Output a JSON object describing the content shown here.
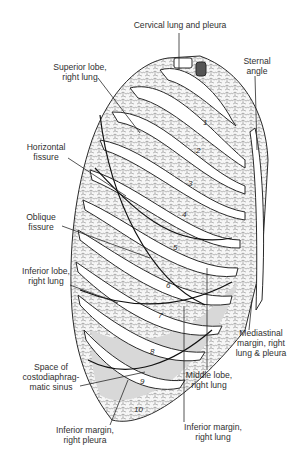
{
  "figure": {
    "rib_numbers": [
      "1",
      "2",
      "3",
      "4",
      "5",
      "6",
      "7",
      "8",
      "9",
      "10"
    ]
  },
  "labels": {
    "cervical": {
      "lines": [
        "Cervical lung and pleura"
      ]
    },
    "superior_lobe": {
      "lines": [
        "Superior lobe,",
        "right lung"
      ]
    },
    "sternal_angle": {
      "lines": [
        "Sternal",
        "angle"
      ]
    },
    "horizontal_fissure": {
      "lines": [
        "Horizontal",
        "fissure"
      ]
    },
    "oblique_fissure": {
      "lines": [
        "Oblique",
        "fissure"
      ]
    },
    "inferior_lobe": {
      "lines": [
        "Inferior lobe,",
        "right lung"
      ]
    },
    "mediastinal_margin": {
      "lines": [
        "Mediastinal",
        "margin, right",
        "lung & pleura"
      ]
    },
    "costodiaphragmatic": {
      "lines": [
        "Space of",
        "costodiaphrag-",
        "matic sinus"
      ]
    },
    "middle_lobe": {
      "lines": [
        "Middle lobe,",
        "right lung"
      ]
    },
    "inferior_margin_pleura": {
      "lines": [
        "Inferior margin,",
        "right pleura"
      ]
    },
    "inferior_margin_lung": {
      "lines": [
        "Inferior margin,",
        "right lung"
      ]
    }
  },
  "colors": {
    "ink": "#2a2a2a",
    "lung_fill": "#f4f4f4",
    "sinus_shade": "#d6d6d6",
    "background": "#ffffff"
  }
}
